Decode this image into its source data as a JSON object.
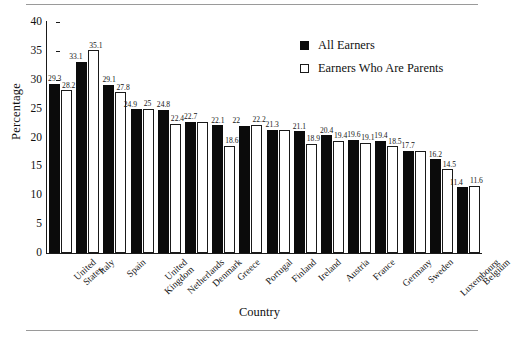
{
  "chart_data": {
    "type": "bar",
    "title": "",
    "xlabel": "Country",
    "ylabel": "Percentage",
    "ylim": [
      0,
      40
    ],
    "yticks": [
      0,
      5,
      10,
      15,
      20,
      25,
      30,
      35,
      40
    ],
    "grid": false,
    "legend_position": "top-right",
    "categories": [
      "United States",
      "Italy",
      "Spain",
      "United Kingdom",
      "Netherlands",
      "Denmark",
      "Greece",
      "Portugal",
      "Finland",
      "Ireland",
      "Austria",
      "France",
      "Germany",
      "Sweden",
      "Luxembourg",
      "Belgium"
    ],
    "series": [
      {
        "name": "All Earners",
        "color": "#0b0b0b",
        "values": [
          29.3,
          33.1,
          29.1,
          24.9,
          24.8,
          22.7,
          22.1,
          22.0,
          21.3,
          21.1,
          20.4,
          19.6,
          19.4,
          17.7,
          16.2,
          11.4
        ]
      },
      {
        "name": "Earners Who Are Parents",
        "color": "#ffffff",
        "values": [
          28.2,
          35.1,
          27.8,
          25.0,
          22.4,
          22.7,
          18.6,
          22.2,
          21.3,
          18.9,
          19.4,
          19.1,
          18.5,
          17.7,
          14.5,
          11.6
        ]
      }
    ],
    "bar_labels": [
      {
        "all": "29.3",
        "parents": "28.2"
      },
      {
        "all": "33.1",
        "parents": "35.1"
      },
      {
        "all": "29.1",
        "parents": "27.8"
      },
      {
        "all": "24.9",
        "parents": "25"
      },
      {
        "all": "24.8",
        "parents": "22.4"
      },
      {
        "all": "22.7",
        "parents": ""
      },
      {
        "all": "22.1",
        "parents": "18.6"
      },
      {
        "all": "22",
        "parents": "22.2"
      },
      {
        "all": "21.3",
        "parents": ""
      },
      {
        "all": "21.1",
        "parents": "18.9"
      },
      {
        "all": "20.4",
        "parents": "19.4"
      },
      {
        "all": "19.6",
        "parents": "19.1"
      },
      {
        "all": "19.4",
        "parents": "18.5"
      },
      {
        "all": "17.7",
        "parents": ""
      },
      {
        "all": "16.2",
        "parents": "14.5"
      },
      {
        "all": "11.4",
        "parents": "11.6"
      }
    ]
  },
  "axis": {
    "ylabel": "Percentage",
    "xlabel": "Country",
    "yticks": [
      "40",
      "35",
      "30",
      "25",
      "20",
      "15",
      "10",
      "5",
      "0"
    ]
  },
  "legend": {
    "items": [
      {
        "label": "All Earners",
        "style": "filled"
      },
      {
        "label": "Earners Who Are Parents",
        "style": "hollow"
      }
    ]
  },
  "xtick_labels": [
    "United\nStates",
    "Italy",
    "Spain",
    "United\nKingdom",
    "Netherlands",
    "Denmark",
    "Greece",
    "Portugal",
    "Finland",
    "Ireland",
    "Austria",
    "France",
    "Germany",
    "Sweden",
    "Luxembourg",
    "Belgium"
  ]
}
